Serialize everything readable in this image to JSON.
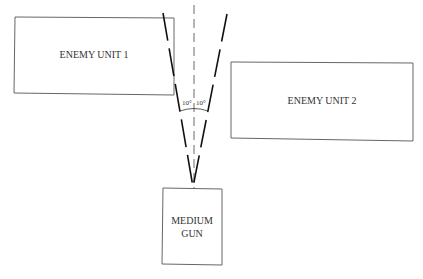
{
  "diagram": {
    "units": [
      {
        "id": "enemy1",
        "label_lines": [
          "ENEMY UNIT 1"
        ]
      },
      {
        "id": "enemy2",
        "label_lines": [
          "ENEMY UNIT 2"
        ]
      },
      {
        "id": "gun",
        "label_lines": [
          "MEDIUM",
          "GUN"
        ]
      }
    ],
    "angles": {
      "left": "10°",
      "right": "10°"
    },
    "colors": {
      "box_stroke": "#555555",
      "line_stroke": "#111111",
      "text": "#333333"
    }
  }
}
